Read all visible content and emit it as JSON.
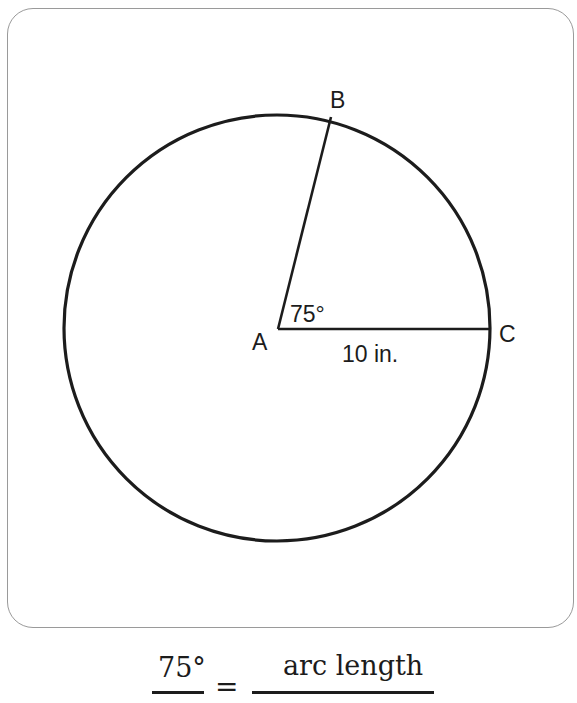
{
  "diagram": {
    "type": "circle-sector",
    "points": {
      "A": {
        "label": "A",
        "role": "center"
      },
      "B": {
        "label": "B",
        "role": "point-on-circle"
      },
      "C": {
        "label": "C",
        "role": "point-on-circle"
      }
    },
    "angle_label": "75°",
    "radius_label": "10 in.",
    "central_angle_degrees": 75,
    "radius_inches": 10
  },
  "formula": {
    "left_numerator": "75°",
    "equals": "=",
    "right_numerator": "arc length"
  }
}
